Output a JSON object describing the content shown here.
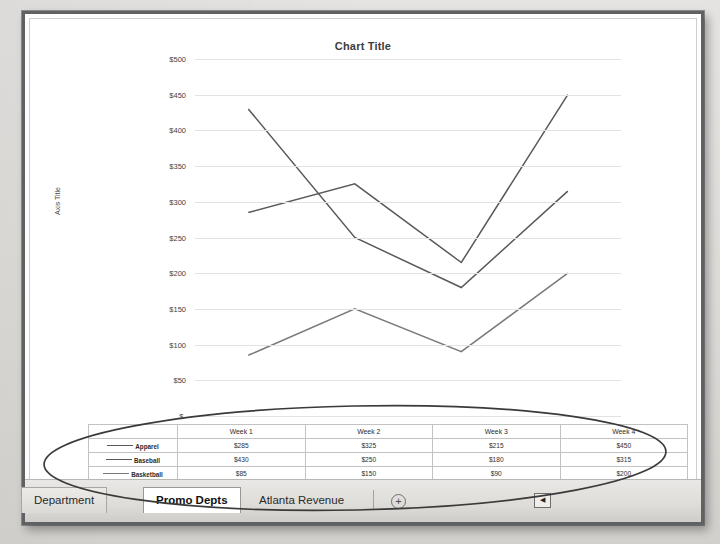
{
  "workbook": {
    "tabs": [
      {
        "label": "Department",
        "active": false
      },
      {
        "label": "Promo Depts",
        "active": true
      },
      {
        "label": "Atlanta Revenue",
        "active": false
      }
    ],
    "new_sheet_label": "+",
    "scroll_left_label": "◀"
  },
  "chart_data": {
    "type": "line",
    "title": "Chart Title",
    "xlabel": "",
    "ylabel": "Axis Title",
    "categories": [
      "Week 1",
      "Week 2",
      "Week 3",
      "Week 4"
    ],
    "series": [
      {
        "name": "Apparel",
        "values": [
          285,
          325,
          215,
          450
        ],
        "color": "#595959"
      },
      {
        "name": "Baseball",
        "values": [
          430,
          250,
          180,
          315
        ],
        "color": "#595959"
      },
      {
        "name": "Basketball",
        "values": [
          85,
          150,
          90,
          200
        ],
        "color": "#7a7a7a"
      }
    ],
    "ylim": [
      0,
      500
    ],
    "ytick_step": 50,
    "ytick_labels": [
      "$500",
      "$450",
      "$400",
      "$350",
      "$300",
      "$250",
      "$200",
      "$150",
      "$100",
      "$50",
      "$-"
    ],
    "grid": true,
    "legend_position": "bottom-table",
    "data_table_visible": true,
    "value_prefix": "$"
  },
  "data_table": {
    "column_headers": [
      "",
      "Week 1",
      "Week 2",
      "Week 3",
      "Week 4"
    ],
    "rows": [
      {
        "label": "Apparel",
        "cells": [
          "$285",
          "$325",
          "$215",
          "$450"
        ]
      },
      {
        "label": "Baseball",
        "cells": [
          "$430",
          "$250",
          "$180",
          "$315"
        ]
      },
      {
        "label": "Basketball",
        "cells": [
          "$85",
          "$150",
          "$90",
          "$200"
        ]
      }
    ]
  },
  "annotation": {
    "shape": "hand-drawn-ellipse",
    "color": "#3a3a3a"
  }
}
